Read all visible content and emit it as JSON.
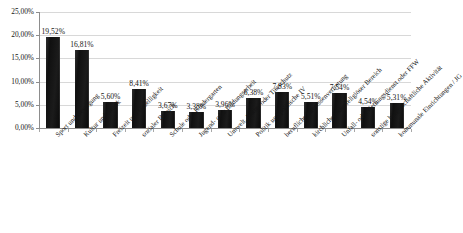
{
  "chart_data": {
    "type": "bar",
    "title": "",
    "subtitle": "",
    "xlabel": "",
    "ylabel": "",
    "ylim": [
      0,
      25
    ],
    "ytick_labels": [
      "25,00%",
      "20,00%",
      "15,00%",
      "10,00%",
      "5,00%",
      "0,00%"
    ],
    "ytick_values": [
      25,
      20,
      15,
      10,
      5,
      0
    ],
    "grid": true,
    "legend": "none",
    "categories": [
      "Sport und Bewegung",
      "Kultur und Musik",
      "Freizeit und Geselligkeit",
      "sozialer Bereich",
      "Schule oder Kindergarten",
      "Jugend- oder Bildungsarbeit",
      "Umwelt, Natur- oder Tierschutz",
      "Politik und politische IV",
      "berufliche Interessenvertretung",
      "kirchlicher oder religiöser Bereich",
      "Unfall- oder Rettungsdienst oder FFW",
      "sonstige bürgerschaftliche Aktivität",
      "kommunale Einrichtungen / JG"
    ],
    "values": [
      19.52,
      16.81,
      5.6,
      8.41,
      3.67,
      3.38,
      3.96,
      6.38,
      7.83,
      5.51,
      7.54,
      4.54,
      5.31
    ],
    "value_labels": [
      "19,52%",
      "16,81%",
      "5,60%",
      "8,41%",
      "3,67%",
      "3,38%",
      "3,96%",
      "6,38%",
      "7,83%",
      "5,51%",
      "7,54%",
      "4,54%",
      "5,31%"
    ],
    "colors": {
      "bar": "#151515",
      "axis": "#8d8d8d",
      "grid": "#d8d8d8",
      "text": "#151515",
      "background": "#ffffff"
    }
  }
}
